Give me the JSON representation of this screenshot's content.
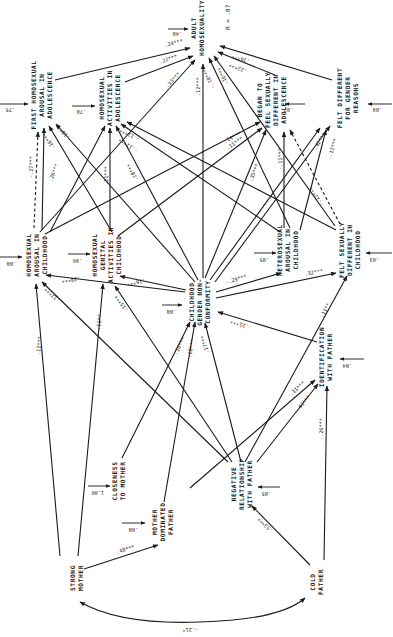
{
  "diagram": {
    "r_squared": "R = .87",
    "nodes": {
      "adult_homosexuality": {
        "lines": [
          "ADULT",
          "HOMOSEXUALITY"
        ],
        "residual": ".48"
      },
      "first_homosexual_arousal_adolescence": {
        "lines": [
          "FIRST HOMOSEXUAL",
          "AROUSAL IN",
          "ADOLESCENCE"
        ],
        "residual": ".75"
      },
      "homosexual_activities_adolescence": {
        "lines": [
          "HOMOSEXUAL",
          "ACTIVITIES IN",
          "ADOLESCENCE"
        ],
        "residual": ".78"
      },
      "began_feel_sexually_different_adolescence": {
        "lines": [
          "BEGAN TO",
          "FEEL SEXUALLY",
          "DIFFERENT IN",
          "ADOLESCENCE"
        ],
        "residual": ".87"
      },
      "felt_different_gender_reasons": {
        "lines": [
          "FELT DIFFERENT",
          "FOR GENDER",
          "REASONS"
        ],
        "residual": ".89"
      },
      "homosexual_arousal_childhood": {
        "lines": [
          "HOMOSEXUAL",
          "AROUSAL IN",
          "CHILDHOOD"
        ],
        "residual": ".88"
      },
      "homosexual_genital_activities_childhood": {
        "lines": [
          "HOMOSEXUAL",
          "GENITAL",
          "ACTIVITIES IN",
          "CHILDHOOD"
        ],
        "residual": ".96"
      },
      "heterosexual_arousal_childhood": {
        "lines": [
          "HETEROSEXUAL",
          "AROUSAL IN",
          "CHILDHOOD"
        ],
        "residual": ".95"
      },
      "felt_sexually_different_childhood": {
        "lines": [
          "FELT SEXUALLY",
          "DIFFERENT IN",
          "CHILDHOOD"
        ],
        "residual": ".93"
      },
      "childhood_gender_nonconformity": {
        "lines": [
          "CHILDHOOD",
          "GENDER NON-",
          "CONFORMITY"
        ],
        "residual": ".88"
      },
      "identification_with_father": {
        "lines": [
          "IDENTIFICATION",
          "WITH FATHER"
        ],
        "residual": ".84"
      },
      "closeness_to_mother": {
        "lines": [
          "CLOSENESS",
          "TO MOTHER"
        ],
        "residual": "1.00"
      },
      "mother_dominated_father": {
        "lines": [
          "MOTHER",
          "DOMINATED",
          "FATHER"
        ],
        "residual": ".88"
      },
      "negative_relationship_with_father": {
        "lines": [
          "NEGATIVE",
          "RELATIONSHIP",
          "WITH FATHER"
        ],
        "residual": ".85"
      },
      "strong_mother": {
        "lines": [
          "STRONG",
          "MOTHER"
        ]
      },
      "cold_father": {
        "lines": [
          "COLD",
          "FATHER"
        ]
      }
    },
    "paths": [
      {
        "from": "first_homosexual_arousal_adolescence",
        "to": "adult_homosexuality",
        "coef": ".24***"
      },
      {
        "from": "homosexual_activities_adolescence",
        "to": "adult_homosexuality",
        "coef": ".22***"
      },
      {
        "from": "homosexual_arousal_childhood",
        "to": "adult_homosexuality",
        "coef": ".33***"
      },
      {
        "from": "childhood_gender_nonconformity",
        "to": "adult_homosexuality",
        "coef": ".12***"
      },
      {
        "from": "heterosexual_arousal_childhood",
        "to": "adult_homosexuality",
        "coef": "-.10***"
      },
      {
        "from": "felt_sexually_different_childhood",
        "to": "adult_homosexuality",
        "coef": ".10***"
      },
      {
        "from": "began_feel_sexually_different_adolescence",
        "to": "adult_homosexuality",
        "coef": ".22***"
      },
      {
        "from": "felt_different_gender_reasons",
        "to": "adult_homosexuality",
        "coef": ".16***"
      },
      {
        "from": "homosexual_arousal_childhood",
        "to": "first_homosexual_arousal_adolescence",
        "coef": ".26***"
      },
      {
        "from": "homosexual_arousal_childhood",
        "to": "first_homosexual_arousal_adolescence",
        "coef": "-.27***",
        "dashed": true
      },
      {
        "from": "homosexual_genital_activities_childhood",
        "to": "first_homosexual_arousal_adolescence",
        "coef": ".16***"
      },
      {
        "from": "childhood_gender_nonconformity",
        "to": "first_homosexual_arousal_adolescence",
        "coef": "-.18***"
      },
      {
        "from": "homosexual_genital_activities_childhood",
        "to": "homosexual_activities_adolescence",
        "coef": ".21***"
      },
      {
        "from": "childhood_gender_nonconformity",
        "to": "homosexual_activities_adolescence",
        "coef": ".18***"
      },
      {
        "from": "heterosexual_arousal_childhood",
        "to": "homosexual_activities_adolescence",
        "coef": "-.11***"
      },
      {
        "from": "felt_sexually_different_childhood",
        "to": "homosexual_activities_adolescence",
        "coef": "-.13***"
      },
      {
        "from": "homosexual_arousal_childhood",
        "to": "began_feel_sexually_different_adolescence",
        "coef": ".14***"
      },
      {
        "from": "homosexual_genital_activities_childhood",
        "to": "began_feel_sexually_different_adolescence",
        "coef": ".11***"
      },
      {
        "from": "childhood_gender_nonconformity",
        "to": "began_feel_sexually_different_adolescence",
        "coef": ".35***"
      },
      {
        "from": "heterosexual_arousal_childhood",
        "to": "began_feel_sexually_different_adolescence",
        "coef": "-.11***"
      },
      {
        "from": "felt_sexually_different_childhood",
        "to": "began_feel_sexually_different_adolescence",
        "coef": "-.12***",
        "dashed": true
      },
      {
        "from": "childhood_gender_nonconformity",
        "to": "felt_different_gender_reasons",
        "coef": ".42***"
      },
      {
        "from": "felt_sexually_different_childhood",
        "to": "felt_different_gender_reasons",
        "coef": "-.12***"
      },
      {
        "from": "childhood_gender_nonconformity",
        "to": "homosexual_arousal_childhood",
        "coef": ".38***"
      },
      {
        "from": "childhood_gender_nonconformity",
        "to": "homosexual_genital_activities_childhood",
        "coef": ".16***"
      },
      {
        "from": "childhood_gender_nonconformity",
        "to": "heterosexual_arousal_childhood",
        "coef": "-.29***"
      },
      {
        "from": "childhood_gender_nonconformity",
        "to": "felt_sexually_different_childhood",
        "coef": ".32***"
      },
      {
        "from": "strong_mother",
        "to": "homosexual_arousal_childhood",
        "coef": ".12***"
      },
      {
        "from": "negative_relationship_with_father",
        "to": "homosexual_arousal_childhood",
        "coef": ".17***"
      },
      {
        "from": "strong_mother",
        "to": "homosexual_genital_activities_childhood",
        "coef": ".11**"
      },
      {
        "from": "negative_relationship_with_father",
        "to": "homosexual_genital_activities_childhood",
        "coef": ".15***"
      },
      {
        "from": "closeness_to_mother",
        "to": "childhood_gender_nonconformity",
        "coef": ".16***"
      },
      {
        "from": "mother_dominated_father",
        "to": "childhood_gender_nonconformity",
        "coef": ".18***"
      },
      {
        "from": "negative_relationship_with_father",
        "to": "childhood_gender_nonconformity",
        "coef": ".17***"
      },
      {
        "from": "identification_with_father",
        "to": "childhood_gender_nonconformity",
        "coef": "-.21***"
      },
      {
        "from": "identification_with_father",
        "to": "felt_sexually_different_childhood",
        "coef": ".11**"
      },
      {
        "from": "negative_relationship_with_father",
        "to": "identification_with_father",
        "coef": "-.11***"
      },
      {
        "from": "mother_dominated_father",
        "to": "identification_with_father",
        "coef": "-.43***"
      },
      {
        "from": "cold_father",
        "to": "identification_with_father",
        "coef": "-.26***"
      },
      {
        "from": "strong_mother",
        "to": "mother_dominated_father",
        "coef": ".48***"
      },
      {
        "from": "cold_father",
        "to": "negative_relationship_with_father",
        "coef": ".53***"
      },
      {
        "from": "strong_mother",
        "to": "cold_father",
        "coef": "-.21*",
        "bidirectional": true
      }
    ]
  }
}
